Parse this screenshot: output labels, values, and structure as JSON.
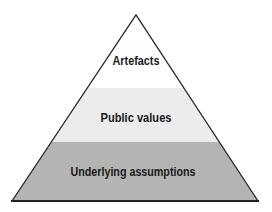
{
  "diagram": {
    "type": "pyramid",
    "levels": [
      {
        "label": "Artefacts",
        "fill": "#ffffff"
      },
      {
        "label": "Public values",
        "fill": "#ececec"
      },
      {
        "label": "Underlying assumptions",
        "fill": "#b4b4b4"
      }
    ],
    "outline_color": "#222222"
  }
}
